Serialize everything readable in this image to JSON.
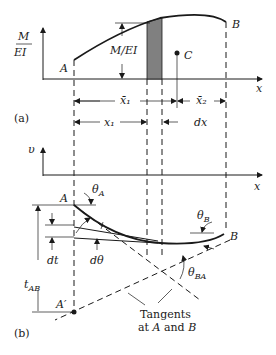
{
  "figure": {
    "part_a": {
      "label": "(a)",
      "y_axis_label_num": "M",
      "y_axis_label_den": "EI",
      "x_axis_label": "x",
      "point_A": "A",
      "point_B": "B",
      "centroid_label": "C",
      "ordinate_label": "M/EI",
      "dim_x1_bar": "x̄₁",
      "dim_x2_bar": "x̄₂",
      "dim_x1": "x₁",
      "dim_dx": "dx"
    },
    "part_b": {
      "label": "(b)",
      "y_axis_label": "υ",
      "x_axis_label": "x",
      "point_A": "A",
      "point_A_prime": "A′",
      "point_B": "B",
      "theta_A": "θ",
      "theta_A_sub": "A",
      "theta_B": "θ",
      "theta_B_sub": "B",
      "theta_BA": "θ",
      "theta_BA_sub": "BA",
      "dt_label": "dt",
      "dtheta_label": "dθ",
      "t_AB": "t",
      "t_AB_sub": "AB",
      "tangents_line1": "Tangents",
      "tangents_line2_pre": "at ",
      "tangents_line2_A": "A",
      "tangents_line2_mid": " and ",
      "tangents_line2_B": "B"
    },
    "colors": {
      "line": "#1a1a1a",
      "shaded_strip": "#808080"
    }
  }
}
